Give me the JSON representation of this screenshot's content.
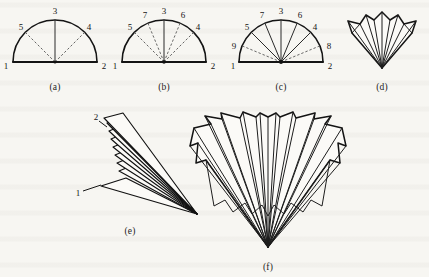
{
  "figure": {
    "background_color": "#f7f6f2",
    "ink_color": "#141414",
    "width": 429,
    "height": 277
  },
  "panels": [
    {
      "id": "a",
      "caption": "(a)",
      "caption_x": 55,
      "caption_y": 82,
      "type": "semicircle-with-radii",
      "center": {
        "x": 55,
        "y": 62
      },
      "radius": 42,
      "base_endpoints": {
        "left_x": 13,
        "right_x": 97,
        "y": 62
      },
      "spokes": [
        {
          "label": "3",
          "angle_deg": 90,
          "style": "solid",
          "label_x": 55,
          "label_y": 11
        },
        {
          "label": "5",
          "angle_deg": 135,
          "style": "dashed",
          "label_x": 21,
          "label_y": 27
        },
        {
          "label": "4",
          "angle_deg": 45,
          "style": "dashed",
          "label_x": 89,
          "label_y": 27
        }
      ],
      "corner_labels": [
        {
          "label": "1",
          "x": 6,
          "y": 66
        },
        {
          "label": "2",
          "x": 104,
          "y": 66
        }
      ]
    },
    {
      "id": "b",
      "caption": "(b)",
      "caption_x": 164,
      "caption_y": 82,
      "type": "semicircle-with-radii",
      "center": {
        "x": 164,
        "y": 62
      },
      "radius": 42,
      "base_endpoints": {
        "left_x": 122,
        "right_x": 206,
        "y": 62
      },
      "spokes": [
        {
          "label": "3",
          "angle_deg": 90,
          "style": "solid",
          "label_x": 164,
          "label_y": 11
        },
        {
          "label": "7",
          "angle_deg": 112.5,
          "style": "dashed",
          "label_x": 145,
          "label_y": 15
        },
        {
          "label": "6",
          "angle_deg": 67.5,
          "style": "dashed",
          "label_x": 183,
          "label_y": 15
        },
        {
          "label": "5",
          "angle_deg": 135,
          "style": "dashed",
          "label_x": 130,
          "label_y": 27
        },
        {
          "label": "4",
          "angle_deg": 45,
          "style": "dashed",
          "label_x": 198,
          "label_y": 27
        }
      ],
      "corner_labels": [
        {
          "label": "1",
          "x": 115,
          "y": 66
        },
        {
          "label": "2",
          "x": 213,
          "y": 66
        }
      ]
    },
    {
      "id": "c",
      "caption": "(c)",
      "caption_x": 281,
      "caption_y": 82,
      "type": "semicircle-with-radii",
      "center": {
        "x": 281,
        "y": 62
      },
      "radius": 42,
      "base_endpoints": {
        "left_x": 239,
        "right_x": 323,
        "y": 62
      },
      "spokes": [
        {
          "label": "3",
          "angle_deg": 90,
          "style": "solid",
          "label_x": 281,
          "label_y": 11
        },
        {
          "label": "7",
          "angle_deg": 112.5,
          "style": "solid",
          "label_x": 262,
          "label_y": 15
        },
        {
          "label": "6",
          "angle_deg": 67.5,
          "style": "solid",
          "label_x": 300,
          "label_y": 15
        },
        {
          "label": "5",
          "angle_deg": 135,
          "style": "solid",
          "label_x": 247,
          "label_y": 27
        },
        {
          "label": "4",
          "angle_deg": 45,
          "style": "solid",
          "label_x": 315,
          "label_y": 27
        },
        {
          "label": "9",
          "angle_deg": 157.5,
          "style": "dashed",
          "label_x": 234,
          "label_y": 46
        },
        {
          "label": "8",
          "angle_deg": 22.5,
          "style": "dashed",
          "label_x": 329,
          "label_y": 46
        }
      ],
      "corner_labels": [
        {
          "label": "1",
          "x": 233,
          "y": 66
        },
        {
          "label": "2",
          "x": 330,
          "y": 66
        }
      ]
    },
    {
      "id": "d",
      "caption": "(d)",
      "caption_x": 382,
      "caption_y": 82,
      "type": "folded-fan-small",
      "apex": {
        "x": 382,
        "y": 68
      },
      "description": "Partially folded fan with pleated outline"
    },
    {
      "id": "e",
      "caption": "(e)",
      "caption_x": 130,
      "caption_y": 226,
      "type": "collapsed-fan",
      "apex": {
        "x": 197,
        "y": 214
      },
      "vertex_labels": [
        {
          "label": "2",
          "x": 96,
          "y": 117
        },
        {
          "label": "1",
          "x": 78,
          "y": 193
        }
      ],
      "description": "Fully collapsed fan, nested slender blades converging to a point"
    },
    {
      "id": "f",
      "caption": "(f)",
      "caption_x": 268,
      "caption_y": 262,
      "type": "deployed-fan",
      "apex": {
        "x": 268,
        "y": 247
      },
      "description": "Fully deployed pleated fan with stepped outer edge"
    }
  ]
}
